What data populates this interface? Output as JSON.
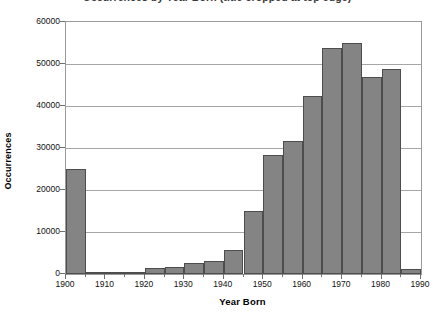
{
  "chart_data": {
    "type": "bar",
    "title": "Occurrences by Year Born (title cropped at top edge)",
    "xlabel": "Year Born",
    "ylabel": "Occurrences",
    "xlim": [
      1900,
      1990
    ],
    "ylim": [
      0,
      60000
    ],
    "grid": true,
    "legend": null,
    "bin_width": 5,
    "bar_color": "#848484",
    "bar_edge_color": "#4d4d4d",
    "grid_color": "#a6a6a6",
    "axis_color": "#9a9a9a",
    "x_tick_labels": [
      "1900",
      "1910",
      "1920",
      "1930",
      "1940",
      "1950",
      "1960",
      "1970",
      "1980",
      "1990"
    ],
    "x_tick_values": [
      1900,
      1910,
      1920,
      1930,
      1940,
      1950,
      1960,
      1970,
      1980,
      1990
    ],
    "y_tick_labels": [
      "0",
      "10000",
      "20000",
      "30000",
      "40000",
      "50000",
      "60000"
    ],
    "y_tick_values": [
      0,
      10000,
      20000,
      30000,
      40000,
      50000,
      60000
    ],
    "categories": [
      1900,
      1905,
      1910,
      1915,
      1920,
      1925,
      1930,
      1935,
      1940,
      1945,
      1950,
      1955,
      1960,
      1965,
      1970,
      1975,
      1980,
      1985
    ],
    "values": [
      24900,
      300,
      400,
      500,
      1400,
      1600,
      2600,
      3000,
      5800,
      14900,
      28300,
      31700,
      42400,
      53800,
      55100,
      46800,
      48700,
      1100
    ],
    "bars": [
      {
        "x0": 1900,
        "x1": 1905,
        "value": 24900
      },
      {
        "x0": 1905,
        "x1": 1910,
        "value": 300
      },
      {
        "x0": 1910,
        "x1": 1915,
        "value": 400
      },
      {
        "x0": 1915,
        "x1": 1920,
        "value": 500
      },
      {
        "x0": 1920,
        "x1": 1925,
        "value": 1400
      },
      {
        "x0": 1925,
        "x1": 1930,
        "value": 1600
      },
      {
        "x0": 1930,
        "x1": 1935,
        "value": 2600
      },
      {
        "x0": 1935,
        "x1": 1940,
        "value": 3000
      },
      {
        "x0": 1940,
        "x1": 1945,
        "value": 5800
      },
      {
        "x0": 1945,
        "x1": 1950,
        "value": 14900
      },
      {
        "x0": 1950,
        "x1": 1955,
        "value": 28300
      },
      {
        "x0": 1955,
        "x1": 1960,
        "value": 31700
      },
      {
        "x0": 1960,
        "x1": 1965,
        "value": 42400
      },
      {
        "x0": 1965,
        "x1": 1970,
        "value": 53800
      },
      {
        "x0": 1970,
        "x1": 1975,
        "value": 55100
      },
      {
        "x0": 1975,
        "x1": 1980,
        "value": 46800
      },
      {
        "x0": 1980,
        "x1": 1985,
        "value": 48700
      },
      {
        "x0": 1985,
        "x1": 1990,
        "value": 1100
      }
    ]
  }
}
